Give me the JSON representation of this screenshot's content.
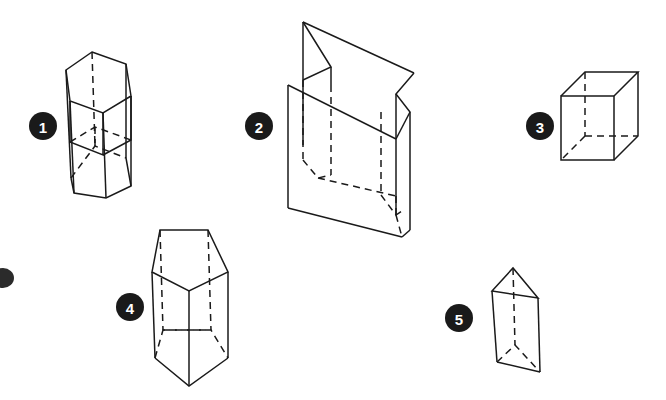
{
  "figure": {
    "background_color": "#ffffff",
    "stroke_color": "#1a1a1a",
    "badge_fill_color": "#1a1a1a",
    "badge_text_color": "#ffffff",
    "hidden_edge_style": "dashed",
    "visible_edge_style": "solid"
  },
  "labels": {
    "one": "1",
    "two": "2",
    "three": "3",
    "four": "4",
    "five": "5"
  },
  "solids": [
    {
      "number": "1",
      "name": "hexagonal-prism-upright",
      "description": "Upright hexagonal prism seen from slightly above, left face foreshortened",
      "badge": {
        "cx": 43,
        "cy": 126,
        "r": 14
      }
    },
    {
      "number": "2",
      "name": "folded-open-box",
      "description": "Open folded box / intersecting planes forming a double-wall enclosure",
      "badge": {
        "cx": 259,
        "cy": 126,
        "r": 14
      }
    },
    {
      "number": "3",
      "name": "cube",
      "description": "Wireframe cube in oblique projection with three hidden edges",
      "badge": {
        "cx": 540,
        "cy": 126,
        "r": 14
      }
    },
    {
      "number": "4",
      "name": "hexagonal-prism-edge-on",
      "description": "Hexagonal prism viewed edge-on with a vertical front edge down the centre",
      "badge": {
        "cx": 130,
        "cy": 307,
        "r": 14
      }
    },
    {
      "number": "5",
      "name": "triangular-prism",
      "description": "Upright triangular prism with apex edge at top",
      "badge": {
        "cx": 459,
        "cy": 318,
        "r": 14
      }
    }
  ],
  "marks": [
    {
      "name": "clipped-dot-left-edge",
      "cx": 3,
      "cy": 278,
      "rx": 11,
      "ry": 10
    }
  ]
}
